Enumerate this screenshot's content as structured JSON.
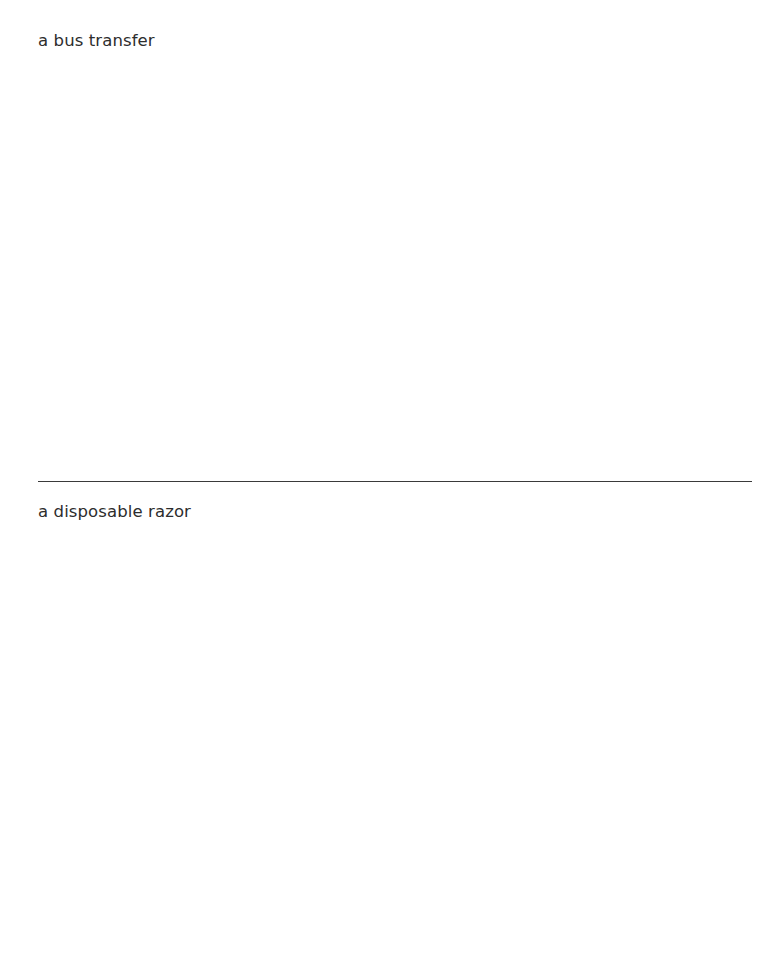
{
  "page": {
    "background_color": "#ffffff",
    "width": 779,
    "height": 977
  },
  "entries": [
    {
      "text": "a bus transfer",
      "color": "#2d2d2d"
    },
    {
      "text": "a disposable razor",
      "color": "#2d2d2d"
    }
  ],
  "divider": {
    "color": "#3a3a3a"
  }
}
